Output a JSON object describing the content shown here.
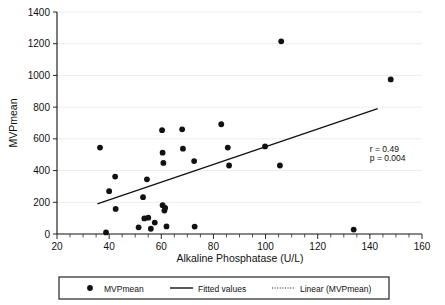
{
  "chart_data": {
    "type": "scatter",
    "title": "",
    "xlabel": "Alkaline Phosphatase  (U/L)",
    "ylabel": "MVPmean",
    "xlim": [
      20,
      160
    ],
    "ylim": [
      0,
      1400
    ],
    "xticks": [
      20,
      40,
      60,
      80,
      100,
      120,
      140,
      160
    ],
    "xtick_labels": [
      "20",
      "40",
      "60",
      "80",
      "100",
      "120",
      "140",
      "160"
    ],
    "yticks": [
      0,
      200,
      400,
      600,
      800,
      1000,
      1200,
      1400
    ],
    "ytick_labels": [
      "0",
      "200",
      "400",
      "600",
      "800",
      "1000",
      "1200",
      "1400"
    ],
    "x_minor_tick_step": 5,
    "grid": "horizontal",
    "legend_position": "bottom",
    "series": [
      {
        "name": "MVPmean",
        "marker": "circle",
        "color": "#111111",
        "points": [
          [
            36.5,
            545
          ],
          [
            38.8,
            10
          ],
          [
            40.0,
            270
          ],
          [
            42.3,
            362
          ],
          [
            42.5,
            158
          ],
          [
            51.3,
            42
          ],
          [
            53.0,
            232
          ],
          [
            53.5,
            98
          ],
          [
            54.5,
            345
          ],
          [
            55.0,
            103
          ],
          [
            56.0,
            33
          ],
          [
            57.5,
            72
          ],
          [
            60.3,
            655
          ],
          [
            60.5,
            513
          ],
          [
            60.8,
            448
          ],
          [
            60.5,
            182
          ],
          [
            61.2,
            148
          ],
          [
            61.5,
            165
          ],
          [
            62.0,
            48
          ],
          [
            68.0,
            660
          ],
          [
            68.3,
            538
          ],
          [
            72.6,
            460
          ],
          [
            72.8,
            47
          ],
          [
            83.0,
            692
          ],
          [
            85.5,
            545
          ],
          [
            86.0,
            432
          ],
          [
            99.8,
            552
          ],
          [
            105.5,
            432
          ],
          [
            106.0,
            1215
          ],
          [
            133.8,
            28
          ],
          [
            148.0,
            975
          ]
        ]
      }
    ],
    "fit_line": {
      "name": "Fitted values",
      "x_start": 35.5,
      "y_start": 190,
      "x_end": 143.0,
      "y_end": 790,
      "color": "#111111"
    },
    "annotations": [
      {
        "text": "r = 0.49",
        "x": 140,
        "y": 520
      },
      {
        "text": "p = 0.004",
        "x": 140,
        "y": 460
      }
    ],
    "legend": [
      {
        "label": "MVPmean",
        "marker": "circle"
      },
      {
        "label": "Fitted values",
        "marker": "solid-line"
      },
      {
        "label": "Linear (MVPmean)",
        "marker": "dotted-line"
      }
    ]
  }
}
